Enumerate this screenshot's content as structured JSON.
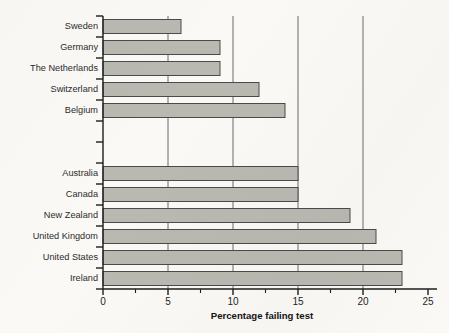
{
  "chart_data": {
    "type": "bar",
    "orientation": "horizontal",
    "title": "",
    "xlabel": "Percentage failing test",
    "ylabel": "",
    "xlim": [
      0,
      25
    ],
    "xticks": [
      0,
      5,
      10,
      15,
      20,
      25
    ],
    "xtick_labels": [
      "0",
      "5",
      "10",
      "15",
      "20",
      "25"
    ],
    "xminor_ticks": [
      2.5,
      7.5,
      12.5,
      17.5,
      22.5
    ],
    "gridlines": [
      5,
      10,
      15,
      20
    ],
    "grid": true,
    "legend": "none",
    "bar_fill_color": "#b9b9b2",
    "bar_edge_color": "#4a4a4a",
    "background_color": "#faf9f6",
    "categories": [
      "Sweden",
      "Germany",
      "The Netherlands",
      "Switzerland",
      "Belgium",
      "",
      "",
      "Australia",
      "Canada",
      "New Zealand",
      "United Kingdom",
      "United States",
      "Ireland"
    ],
    "values": [
      6,
      9,
      9,
      12,
      14,
      null,
      null,
      15,
      15,
      19,
      21,
      23,
      23
    ]
  }
}
